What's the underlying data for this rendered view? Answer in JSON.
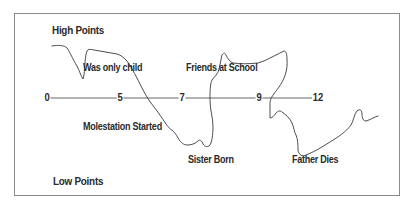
{
  "diagram": {
    "title_high": "High Points",
    "title_low": "Low Points",
    "axis": {
      "ticks": [
        {
          "label": "0",
          "x": 47
        },
        {
          "label": "5",
          "x": 120
        },
        {
          "label": "7",
          "x": 182
        },
        {
          "label": "9",
          "x": 259
        },
        {
          "label": "12",
          "x": 318
        }
      ]
    },
    "events": [
      {
        "label": "Was only child",
        "position": "above",
        "age_range": "0-5"
      },
      {
        "label": "Molestation Started",
        "position": "below",
        "age_range": "5-7"
      },
      {
        "label": "Sister Born",
        "position": "below",
        "age_range": "7"
      },
      {
        "label": "Friends at School",
        "position": "above",
        "age_range": "7-9"
      },
      {
        "label": "Father Dies",
        "position": "below",
        "age_range": "9-12"
      }
    ],
    "colors": {
      "line": "#3a3a3a",
      "axis": "#555555",
      "frame": "#8a8a8a",
      "text": "#2a2a2a"
    }
  }
}
